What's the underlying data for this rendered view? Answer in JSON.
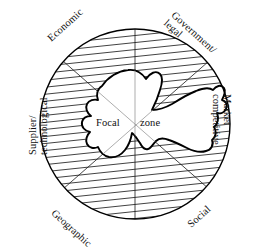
{
  "figure": {
    "name": "focal-zone-environment-diagram",
    "center_label_part1": "Focal",
    "center_label_part2": "zone",
    "colors": {
      "line": "#111111",
      "hatch": "#333333",
      "background": "#ffffff",
      "blob_fill": "#ffffff"
    }
  },
  "sectors": [
    {
      "id": "economic",
      "label": "Economic",
      "angle_deg": 135,
      "rotation_deg": -42
    },
    {
      "id": "government",
      "label": "Government/ legal",
      "angle_deg": 45,
      "rotation_deg": 42
    },
    {
      "id": "market",
      "label": "Market competitive",
      "angle_deg": 0,
      "rotation_deg": 90
    },
    {
      "id": "social",
      "label": "Social",
      "angle_deg": -45,
      "rotation_deg": -42
    },
    {
      "id": "geographic",
      "label": "Geographic",
      "angle_deg": -135,
      "rotation_deg": 42
    },
    {
      "id": "supplier",
      "label": "Supplier/ technological",
      "angle_deg": 180,
      "rotation_deg": -90
    }
  ],
  "labels": {
    "economic": "Economic",
    "government_line1": "Government/",
    "government_line2": "legal",
    "market_line1": "Market",
    "market_line2": "competitive",
    "social": "Social",
    "geographic": "Geographic",
    "supplier_line1": "Supplier/",
    "supplier_line2": "technological"
  },
  "geometry": {
    "circle_center_x": 135,
    "circle_center_y": 124,
    "circle_radius": 95,
    "hatch_spacing_px": 7,
    "hatch_angle_deg": 6,
    "radial_lines": [
      "vertical-diameter",
      "diagonal-nw-se",
      "diagonal-ne-sw"
    ]
  }
}
